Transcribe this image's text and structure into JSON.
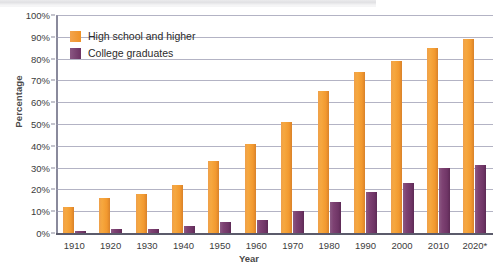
{
  "chart_data": {
    "type": "bar",
    "title": "",
    "xlabel": "Year",
    "ylabel": "Percentage",
    "categories": [
      "1910",
      "1920",
      "1930",
      "1940",
      "1950",
      "1960",
      "1970",
      "1980",
      "1990",
      "2000",
      "2010",
      "2020*"
    ],
    "series": [
      {
        "name": "High school and higher",
        "color": "#F2A03C",
        "values": [
          12,
          16,
          18,
          22,
          33,
          41,
          51,
          65,
          74,
          79,
          85,
          89
        ]
      },
      {
        "name": "College graduates",
        "color": "#7E3F72",
        "values": [
          1,
          2,
          2,
          3,
          5,
          6,
          10,
          14,
          19,
          23,
          30,
          31
        ]
      }
    ],
    "ylim": [
      0,
      100
    ],
    "ytick_values": [
      0,
      10,
      20,
      30,
      40,
      50,
      60,
      70,
      80,
      90,
      100
    ],
    "ytick_labels": [
      "0%",
      "10%",
      "20%",
      "30%",
      "40%",
      "50%",
      "60%",
      "70%",
      "80%",
      "90%",
      "100%"
    ],
    "grid": true,
    "legend_position": "inside-top-left"
  }
}
